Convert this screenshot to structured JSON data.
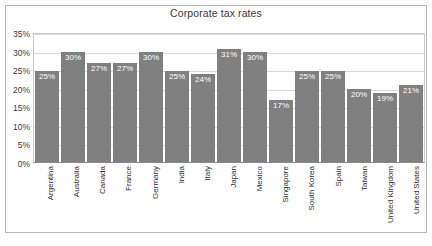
{
  "chart_data": {
    "type": "bar",
    "title": "Corporate tax rates",
    "xlabel": "",
    "ylabel": "",
    "ylim": [
      0,
      35
    ],
    "grid": true,
    "legend": "none",
    "y_ticks": [
      "35%",
      "30%",
      "25%",
      "20%",
      "15%",
      "10%",
      "5%",
      "0%"
    ],
    "y_tick_values": [
      35,
      30,
      25,
      20,
      15,
      10,
      5,
      0
    ],
    "categories": [
      "Argentina",
      "Australia",
      "Canada",
      "France",
      "Germany",
      "India",
      "Italy",
      "Japan",
      "Mexico",
      "Singapore",
      "South Korea",
      "Spain",
      "Taiwan",
      "United Kingdom",
      "United States"
    ],
    "values": [
      25,
      30,
      27,
      27,
      30,
      25,
      24,
      31,
      30,
      17,
      25,
      25,
      20,
      19,
      21
    ],
    "data_labels": [
      "25%",
      "30%",
      "27%",
      "27%",
      "30%",
      "25%",
      "24%",
      "31%",
      "30%",
      "17%",
      "25%",
      "25%",
      "20%",
      "19%",
      "21%"
    ],
    "bar_color": "#808080",
    "data_label_color": "#ffffff",
    "gridline_color": "#d8d8d8",
    "axis_color": "#8a8a8a",
    "background_color": "#ffffff"
  }
}
